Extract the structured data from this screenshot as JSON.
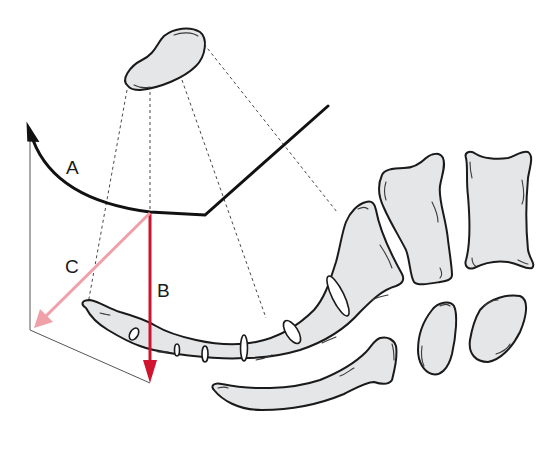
{
  "diagram": {
    "labels": {
      "a": "A",
      "b": "B",
      "c": "C"
    },
    "colors": {
      "arrow_b": "#d0132f",
      "arrow_c": "#f0a0a8",
      "outline": "#1a1a1a",
      "bone_fill": "#e4e6e8",
      "curve": "#111111"
    },
    "elements": [
      "curved arrow A (rotation)",
      "vertical arrow B (red, downward)",
      "diagonal arrow C (pink, down-left)",
      "projection box (thin lines)",
      "projected bone outline (top)",
      "dashed projection lines",
      "sacrum with foramina",
      "vertebral bodies",
      "curved rod-shaped bone",
      "two oval bones"
    ]
  }
}
